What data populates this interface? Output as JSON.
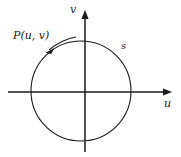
{
  "figure": {
    "type": "math-diagram",
    "background_color": "#ffffff",
    "stroke_color": "#1a1a1a",
    "axes": {
      "vertical": {
        "name": "v-axis",
        "label": "v",
        "arrow": "up",
        "x": 85,
        "y_top": 10,
        "y_bottom": 152
      },
      "horizontal": {
        "name": "u-axis",
        "label": "u",
        "arrow": "right",
        "y": 92,
        "x_left": 8,
        "x_right": 172
      },
      "origin": {
        "x": 85,
        "y": 92
      }
    },
    "curve": {
      "name": "circle-s",
      "label": "s",
      "center_x": 81,
      "center_y": 91,
      "radius": 50
    },
    "point_label": {
      "name": "point-p",
      "text": "P(u, v)",
      "leader_from_x": 72,
      "leader_from_y": 40,
      "leader_to_x": 47,
      "leader_to_y": 51
    }
  }
}
